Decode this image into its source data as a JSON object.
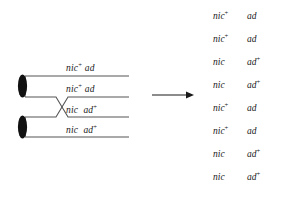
{
  "figure": {
    "type": "genetics-crossover-diagram",
    "background_color": "#ffffff",
    "ink_color": "#1a1a1a",
    "line_color": "#555555"
  },
  "diagram": {
    "name": "four-strand bivalent with single crossover",
    "centromere_count": 2,
    "chromatid_count": 4,
    "crossover_label": "crossover",
    "chromatids": [
      {
        "id": 1,
        "nic": "nic",
        "nic_sup": "+",
        "ad": "ad",
        "ad_sup": ""
      },
      {
        "id": 2,
        "nic": "nic",
        "nic_sup": "+",
        "ad": "ad",
        "ad_sup": ""
      },
      {
        "id": 3,
        "nic": "nic",
        "nic_sup": "",
        "ad": "ad",
        "ad_sup": "+"
      },
      {
        "id": 4,
        "nic": "nic",
        "nic_sup": "",
        "ad": "ad",
        "ad_sup": "+"
      }
    ]
  },
  "arrow": {
    "direction": "right",
    "label": ""
  },
  "products": {
    "title": "",
    "rows": [
      {
        "nic": "nic",
        "nic_sup": "+",
        "ad": "ad",
        "ad_sup": ""
      },
      {
        "nic": "nic",
        "nic_sup": "+",
        "ad": "ad",
        "ad_sup": ""
      },
      {
        "nic": "nic",
        "nic_sup": "",
        "ad": "ad",
        "ad_sup": "+"
      },
      {
        "nic": "nic",
        "nic_sup": "",
        "ad": "ad",
        "ad_sup": "+"
      },
      {
        "nic": "nic",
        "nic_sup": "+",
        "ad": "ad",
        "ad_sup": ""
      },
      {
        "nic": "nic",
        "nic_sup": "+",
        "ad": "ad",
        "ad_sup": ""
      },
      {
        "nic": "nic",
        "nic_sup": "",
        "ad": "ad",
        "ad_sup": "+"
      },
      {
        "nic": "nic",
        "nic_sup": "",
        "ad": "ad",
        "ad_sup": "+"
      }
    ]
  }
}
